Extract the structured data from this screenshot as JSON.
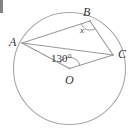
{
  "figure": {
    "background_color": "#ffffff",
    "stroke_color": "#9a9a9a",
    "label_color": "#333333",
    "circle": {
      "center_x": 69.5,
      "center_y": 68.5,
      "radius": 56,
      "center_label": "O"
    },
    "points": [
      {
        "name": "A",
        "label": "A",
        "x": 22.0,
        "y": 43.0,
        "label_x": 9,
        "label_y": 36
      },
      {
        "name": "B",
        "label": "B",
        "x": 90.0,
        "y": 21.0,
        "label_x": 83,
        "label_y": 6
      },
      {
        "name": "C",
        "label": "C",
        "x": 113.0,
        "y": 55.0,
        "label_x": 118,
        "label_y": 48
      },
      {
        "name": "O",
        "label": "O",
        "x": 69.5,
        "y": 68.5,
        "label_x": 65,
        "label_y": 74
      }
    ],
    "segments": [
      {
        "name": "chord-ab",
        "from": "A",
        "to": "B"
      },
      {
        "name": "chord-bc",
        "from": "B",
        "to": "C"
      },
      {
        "name": "chord-ac",
        "from": "A",
        "to": "C"
      },
      {
        "name": "radius-oa",
        "from": "O",
        "to": "A"
      },
      {
        "name": "radius-oc",
        "from": "O",
        "to": "C"
      }
    ],
    "angles": [
      {
        "name": "central-angle-aoc",
        "vertex": "O",
        "label": "130°",
        "value": 130,
        "unit": "degrees",
        "label_x": 51,
        "label_y": 53,
        "arc_radius": 11
      },
      {
        "name": "inscribed-angle-abc",
        "vertex": "B",
        "label": "x",
        "value": null,
        "unit": "unknown",
        "label_x": 80,
        "label_y": 26,
        "arc_radius": 9
      }
    ],
    "corner_artifact": {
      "name": "cropped-edge-mark",
      "present": true
    }
  }
}
